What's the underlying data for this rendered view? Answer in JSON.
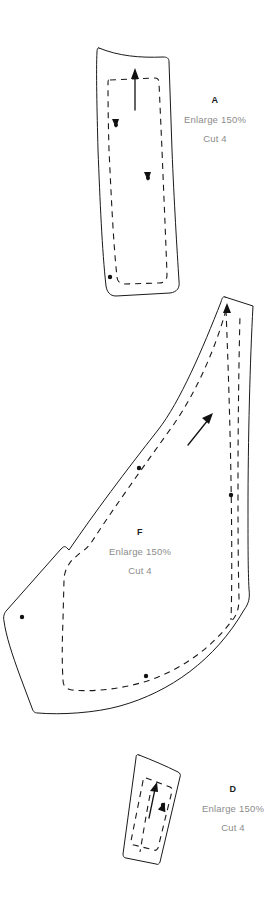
{
  "document": {
    "type": "sewing-pattern-sheet",
    "background_color": "#ffffff",
    "line_color": "#1a1a1a",
    "text_color": "#8c8c8c",
    "heading_color": "#1d1d1d"
  },
  "pieces": [
    {
      "id": "A",
      "enlarge": "Enlarge 150%",
      "cut": "Cut 4",
      "shape": "long curved tapered panel",
      "grainline": "upward arrow",
      "notches": 2
    },
    {
      "id": "F",
      "enlarge": "Enlarge 150%",
      "cut": "Cut 4",
      "shape": "large curved wing panel",
      "grainline": "diagonal up-right arrow",
      "notches": 4
    },
    {
      "id": "D",
      "enlarge": "Enlarge 150%",
      "cut": "Cut 4",
      "shape": "small narrow tapered panel",
      "grainline": "upward arrow",
      "notches": 1
    }
  ]
}
